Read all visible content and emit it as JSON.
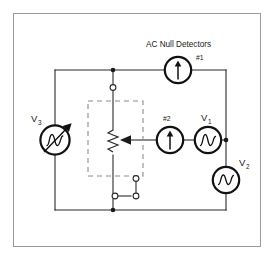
{
  "diagram": {
    "title": "AC Null Detectors",
    "type": "electrical-schematic",
    "background_color": "#ffffff",
    "wire_color": "#2b2b2b",
    "dashed_box_color": "#8c8c8c",
    "border_color": "#9a9a9a"
  },
  "labels": {
    "ac_null_detectors": "AC Null Detectors",
    "detector1": "#1",
    "detector2": "#2",
    "source_v1_name": "V",
    "source_v1_sub": "1",
    "source_v2_name": "V",
    "source_v2_sub": "2",
    "source_v3_name": "V",
    "source_v3_sub": "3"
  },
  "components": [
    {
      "id": "detector1",
      "label": "#1",
      "kind": "ac-null-detector",
      "symbol": "circle-up-arrow",
      "position": "top-rail-right"
    },
    {
      "id": "detector2",
      "label": "#2",
      "kind": "ac-null-detector",
      "symbol": "circle-up-arrow",
      "position": "middle-branch-center"
    },
    {
      "id": "v1",
      "label": "V1",
      "kind": "ac-voltage-source",
      "symbol": "circle-sine",
      "position": "middle-branch-right"
    },
    {
      "id": "v2",
      "label": "V2",
      "kind": "ac-voltage-source",
      "symbol": "circle-sine",
      "position": "right-rail-lower"
    },
    {
      "id": "v3",
      "label": "V3",
      "kind": "variable-ac-voltage-source",
      "symbol": "circle-sine-with-arrow",
      "position": "left-rail-middle"
    },
    {
      "id": "potentiometer",
      "label": "",
      "kind": "potentiometer",
      "symbol": "zigzag-resistor-with-wiper",
      "position": "center-column-inside-dashed-box"
    },
    {
      "id": "shorting-link",
      "label": "",
      "kind": "terminal-link",
      "symbol": "three-open-terminals",
      "position": "center-column-lower"
    }
  ]
}
